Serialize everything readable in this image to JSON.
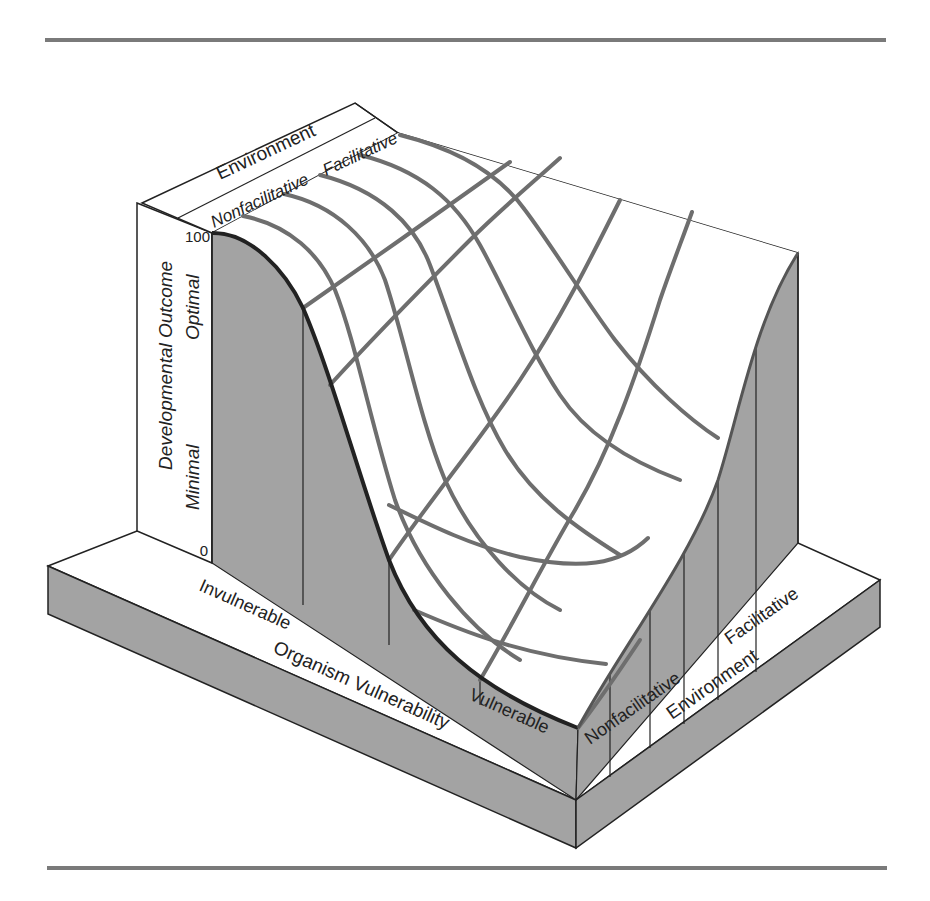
{
  "figure": {
    "type": "3d-surface-diagram",
    "colors": {
      "shade": "#a3a3a3",
      "grid": "#6e6e6e",
      "edge": "#222222",
      "rule": "#7a7a7a",
      "surface": "#ffffff"
    },
    "vertical_axis": {
      "title": "Developmental Outcome",
      "top_tick": "100",
      "bottom_tick": "0",
      "upper_label": "Optimal",
      "lower_label": "Minimal"
    },
    "back_panel": {
      "title": "Environment",
      "left_label": "Nonfacilitative",
      "right_label": "Facilitative"
    },
    "organism_axis": {
      "title": "Organism Vulnerability",
      "start_label": "Invulnerable",
      "end_label": "Vulnerable"
    },
    "environment_axis": {
      "title": "Environment",
      "start_label": "Nonfacilitative",
      "end_label": "Facilitative"
    }
  }
}
